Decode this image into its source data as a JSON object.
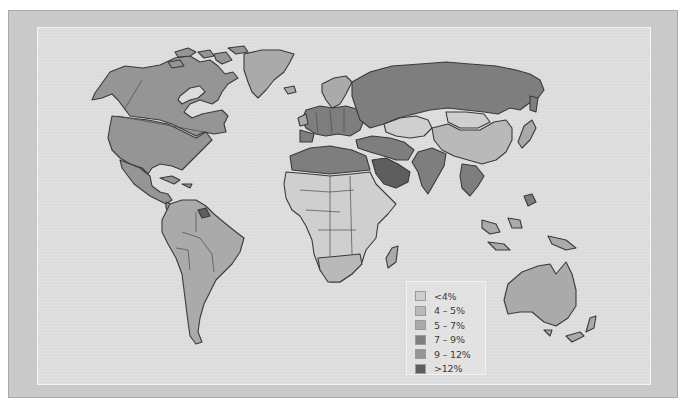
{
  "map": {
    "subject": "World choropleth map of countries shaded by percentage bands",
    "background_color": "#dcdcdc",
    "frame_color": "#c9c9c9",
    "ocean_color": "#dcdcdc"
  },
  "legend": {
    "items": [
      {
        "label": "<4%",
        "color": "#cfcfcf"
      },
      {
        "label": "4 – 5%",
        "color": "#b9b9b9"
      },
      {
        "label": "5 – 7%",
        "color": "#aaaaaa"
      },
      {
        "label": "7 – 9%",
        "color": "#7e7e7e"
      },
      {
        "label": "9 – 12%",
        "color": "#959595"
      },
      {
        "label": ">12%",
        "color": "#5e5e5e"
      }
    ]
  },
  "regions": [
    {
      "name": "Alaska/USA",
      "band": "9 – 12%"
    },
    {
      "name": "Canada",
      "band": "9 – 12%"
    },
    {
      "name": "United States",
      "band": "9 – 12%"
    },
    {
      "name": "Greenland",
      "band": "5 – 7%"
    },
    {
      "name": "Mexico",
      "band": "9 – 12%"
    },
    {
      "name": "Central America",
      "band": "9 – 12%"
    },
    {
      "name": "South America",
      "band": "5 – 7%"
    },
    {
      "name": "Guyana/Suriname",
      "band": ">12%"
    },
    {
      "name": "Russia",
      "band": "7 – 9%"
    },
    {
      "name": "Europe",
      "band": "7 – 9%"
    },
    {
      "name": "Scandinavia",
      "band": "5 – 7%"
    },
    {
      "name": "North Africa",
      "band": "7 – 9%"
    },
    {
      "name": "Sub-Saharan Africa",
      "band": "<4%"
    },
    {
      "name": "Southern Africa",
      "band": "4 – 5%"
    },
    {
      "name": "Saudi Arabia",
      "band": ">12%"
    },
    {
      "name": "Middle East",
      "band": "7 – 9%"
    },
    {
      "name": "India",
      "band": "7 – 9%"
    },
    {
      "name": "Kazakhstan/Central Asia",
      "band": "<4%"
    },
    {
      "name": "Mongolia",
      "band": "<4%"
    },
    {
      "name": "China",
      "band": "4 – 5%"
    },
    {
      "name": "Japan",
      "band": "5 – 7%"
    },
    {
      "name": "Southeast Asia",
      "band": "7 – 9%"
    },
    {
      "name": "Indonesia",
      "band": "5 – 7%"
    },
    {
      "name": "Australia",
      "band": "5 – 7%"
    },
    {
      "name": "New Zealand",
      "band": "5 – 7%"
    }
  ]
}
